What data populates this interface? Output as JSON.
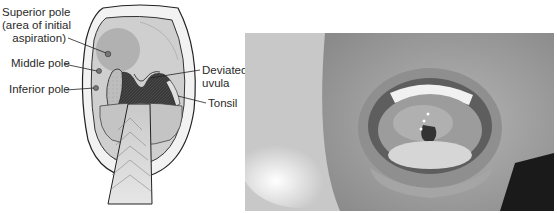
{
  "figure": {
    "illustration": {
      "labels": {
        "superior_pole": [
          "Superior pole",
          "(area of initial",
          "aspiration)"
        ],
        "middle_pole": "Middle pole",
        "inferior_pole": "Inferior pole",
        "deviated_uvula": [
          "Deviated",
          "uvula"
        ],
        "tonsil": "Tonsil"
      }
    },
    "photo": {
      "description": "Photograph of open mouth showing peritonsillar abscess with deviated uvula"
    }
  }
}
